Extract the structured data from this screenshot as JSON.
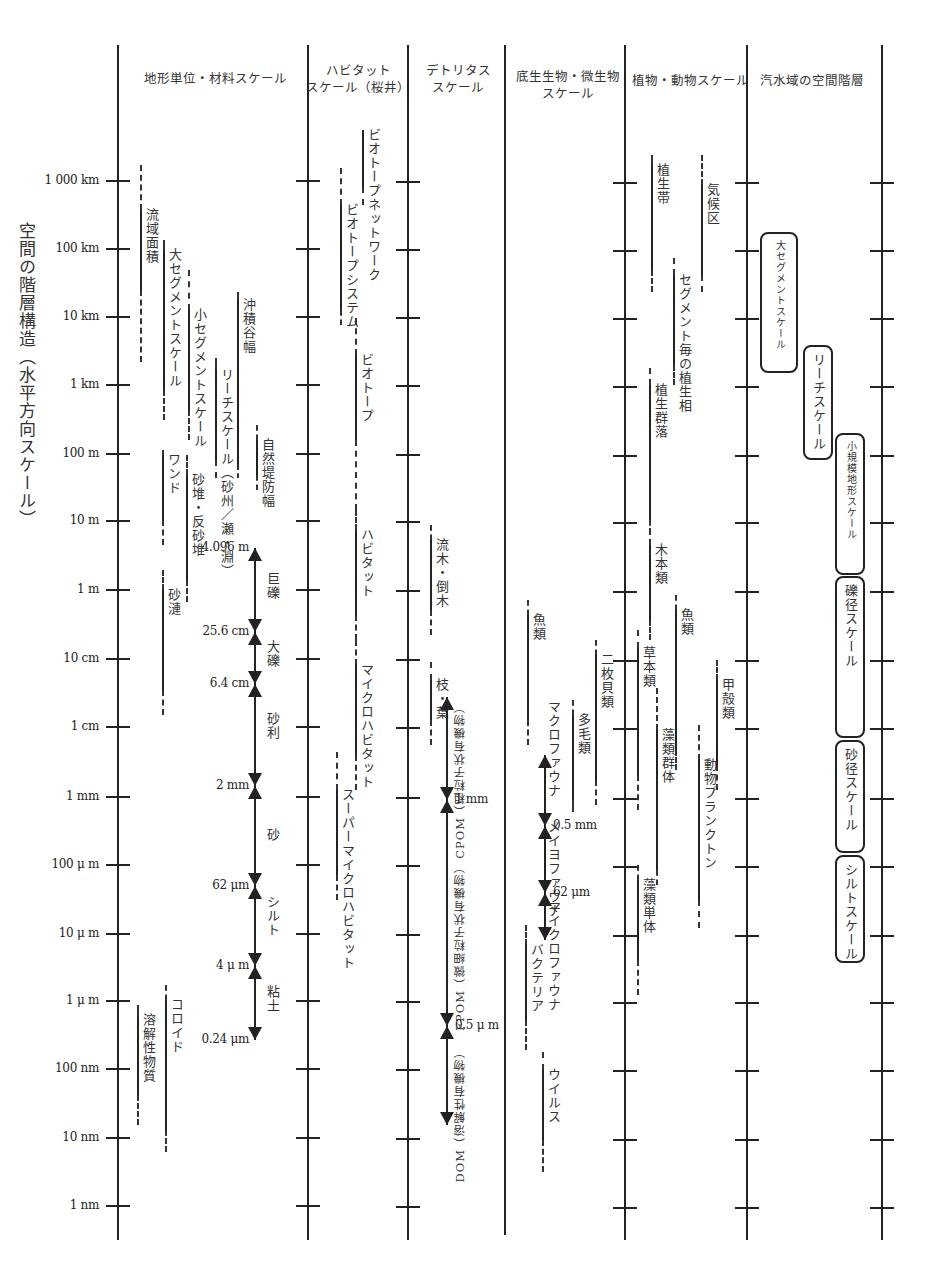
{
  "diagram": {
    "y_axis_title": "空間の階層構造（水平方向スケール）",
    "scale_ticks": [
      {
        "label": "1 000 km",
        "y": 181
      },
      {
        "label": "100 km",
        "y": 249
      },
      {
        "label": "10 km",
        "y": 317
      },
      {
        "label": "1 km",
        "y": 385
      },
      {
        "label": "100 m",
        "y": 454
      },
      {
        "label": "10 m",
        "y": 521
      },
      {
        "label": "1 m",
        "y": 590
      },
      {
        "label": "10 cm",
        "y": 659
      },
      {
        "label": "1 cm",
        "y": 727
      },
      {
        "label": "1 mm",
        "y": 797
      },
      {
        "label": "100 μ m",
        "y": 865
      },
      {
        "label": "10 μ m",
        "y": 934
      },
      {
        "label": "1 μ m",
        "y": 1001
      },
      {
        "label": "100 nm",
        "y": 1069
      },
      {
        "label": "10 nm",
        "y": 1138
      },
      {
        "label": "1 nm",
        "y": 1206
      }
    ],
    "columns": [
      {
        "id": "landform",
        "header": [
          "地形単位・材料スケール"
        ],
        "axis_x": 118,
        "header_x": 215,
        "header_y": 70
      },
      {
        "id": "habitat",
        "header": [
          "ハビタット",
          "スケール（桜井）"
        ],
        "axis_x": 308,
        "header_x": 358,
        "header_y": 62
      },
      {
        "id": "detritus",
        "header": [
          "デトリタス",
          "スケール"
        ],
        "axis_x": 408,
        "header_x": 458,
        "header_y": 62
      },
      {
        "id": "benthos",
        "header": [
          "底生生物・微生物",
          "スケール"
        ],
        "axis_x": 505,
        "header_x": 568,
        "header_y": 68
      },
      {
        "id": "plant_animal",
        "header": [
          "植物・動物スケール"
        ],
        "axis_x": 625,
        "header_x": 690,
        "header_y": 72
      },
      {
        "id": "estuary",
        "header": [
          "汽水域の空間階層"
        ],
        "axis_x": 747,
        "header_x": 812,
        "header_y": 72
      },
      {
        "id": "end",
        "header": [],
        "axis_x": 882
      }
    ],
    "ranges": [
      {
        "label": "流域面積",
        "x": 140,
        "top": 165,
        "solid_top": 210,
        "solid_bottom": 290,
        "bottom": 362
      },
      {
        "label": "大セグメントスケール",
        "x": 163,
        "top": 240,
        "solid_top": 250,
        "solid_bottom": 390,
        "bottom": 420
      },
      {
        "label": "小セグメントスケール",
        "x": 188,
        "top": 270,
        "solid_top": 310,
        "solid_bottom": 410,
        "bottom": 440
      },
      {
        "label": "リーチスケール（砂州／瀬・淵）",
        "x": 215,
        "top": 358,
        "solid_top": 370,
        "solid_bottom": 460,
        "bottom": 478
      },
      {
        "label": "沖積谷幅",
        "x": 237,
        "top": 292,
        "solid_top": 300,
        "solid_bottom": 465,
        "bottom": 478
      },
      {
        "label": "自然堤防幅",
        "x": 256,
        "top": 425,
        "solid_top": 440,
        "solid_bottom": 475,
        "bottom": 490
      },
      {
        "label": "ワンド",
        "x": 162,
        "top": 450,
        "solid_top": 455,
        "solid_bottom": 520,
        "bottom": 545
      },
      {
        "label": "砂堆・反砂堆",
        "x": 186,
        "top": 455,
        "solid_top": 475,
        "solid_bottom": 580,
        "bottom": 602
      },
      {
        "label": "砂漣",
        "x": 162,
        "top": 570,
        "solid_top": 590,
        "solid_bottom": 690,
        "bottom": 715
      },
      {
        "label": "溶解性物質",
        "x": 137,
        "top": 1005,
        "solid_top": 1015,
        "solid_bottom": 1095,
        "bottom": 1125
      },
      {
        "label": "コロイド",
        "x": 165,
        "top": 985,
        "solid_top": 1000,
        "solid_bottom": 1130,
        "bottom": 1152
      },
      {
        "label": "ビオトープネットワーク",
        "x": 362,
        "top": 130,
        "solid_top": 130,
        "solid_bottom": 187,
        "bottom": 205
      },
      {
        "label": "ビオトープシステム",
        "x": 340,
        "top": 168,
        "solid_top": 205,
        "solid_bottom": 310,
        "bottom": 325
      },
      {
        "label": "ビオトープ",
        "x": 355,
        "top": 318,
        "solid_top": 355,
        "solid_bottom": 440,
        "bottom": 510
      },
      {
        "label": "ハビタット",
        "x": 355,
        "top": 510,
        "solid_top": 530,
        "solid_bottom": 615,
        "bottom": 640
      },
      {
        "label": "マイクロハビタット",
        "x": 355,
        "top": 640,
        "solid_top": 665,
        "solid_bottom": 755,
        "bottom": 790
      },
      {
        "label": "スーパーマイクロハビタット",
        "x": 336,
        "top": 752,
        "solid_top": 790,
        "solid_bottom": 875,
        "bottom": 900
      },
      {
        "label": "流木・倒木",
        "x": 430,
        "top": 525,
        "solid_top": 540,
        "solid_bottom": 610,
        "bottom": 635
      },
      {
        "label": "枝・葉",
        "x": 430,
        "top": 662,
        "solid_top": 680,
        "solid_bottom": 720,
        "bottom": 745
      },
      {
        "label": "魚類",
        "x": 527,
        "top": 600,
        "solid_top": 615,
        "solid_bottom": 720,
        "bottom": 745
      },
      {
        "label": "多毛類",
        "x": 572,
        "top": 700,
        "solid_top": 715,
        "solid_bottom": 800,
        "bottom": 812
      },
      {
        "label": "二枚貝類",
        "x": 595,
        "top": 640,
        "solid_top": 655,
        "solid_bottom": 780,
        "bottom": 805
      },
      {
        "label": "バクテリア",
        "x": 525,
        "top": 925,
        "solid_top": 945,
        "solid_bottom": 1020,
        "bottom": 1050
      },
      {
        "label": "ウイルス",
        "x": 542,
        "top": 1052,
        "solid_top": 1070,
        "solid_bottom": 1140,
        "bottom": 1172
      },
      {
        "label": "植生帯",
        "x": 651,
        "top": 155,
        "solid_top": 165,
        "solid_bottom": 270,
        "bottom": 292
      },
      {
        "label": "気候区",
        "x": 701,
        "top": 155,
        "solid_top": 185,
        "solid_bottom": 275,
        "bottom": 292
      },
      {
        "label": "セグメント毎の植生相",
        "x": 673,
        "top": 258,
        "solid_top": 275,
        "solid_bottom": 365,
        "bottom": 385
      },
      {
        "label": "植生群落",
        "x": 649,
        "top": 368,
        "solid_top": 385,
        "solid_bottom": 520,
        "bottom": 535
      },
      {
        "label": "木本類",
        "x": 649,
        "top": 528,
        "solid_top": 545,
        "solid_bottom": 620,
        "bottom": 640
      },
      {
        "label": "魚類",
        "x": 675,
        "top": 595,
        "solid_top": 610,
        "solid_bottom": 750,
        "bottom": 770
      },
      {
        "label": "草本類",
        "x": 637,
        "top": 630,
        "solid_top": 648,
        "solid_bottom": 775,
        "bottom": 810
      },
      {
        "label": "藻類群体",
        "x": 656,
        "top": 688,
        "solid_top": 730,
        "solid_bottom": 870,
        "bottom": 885
      },
      {
        "label": "甲殻類",
        "x": 716,
        "top": 660,
        "solid_top": 680,
        "solid_bottom": 765,
        "bottom": 790
      },
      {
        "label": "動物プランクトン",
        "x": 698,
        "top": 725,
        "solid_top": 760,
        "solid_bottom": 900,
        "bottom": 928
      },
      {
        "label": "藻類単体",
        "x": 637,
        "top": 865,
        "solid_top": 880,
        "solid_bottom": 960,
        "bottom": 995
      }
    ],
    "arrow_scales": [
      {
        "id": "grain-size",
        "x": 255,
        "label_side": "right",
        "bounds": [
          {
            "label": "4.096 m",
            "y": 548
          },
          {
            "label": "25.6 cm",
            "y": 632
          },
          {
            "label": "6.4 cm",
            "y": 684
          },
          {
            "label": "2 mm",
            "y": 786
          },
          {
            "label": "62 μm",
            "y": 886
          },
          {
            "label": "4 μ m",
            "y": 966
          },
          {
            "label": "0.24 μm",
            "y": 1040
          }
        ],
        "classes": [
          {
            "label": "巨礫",
            "y": 572
          },
          {
            "label": "大礫",
            "y": 640
          },
          {
            "label": "砂利",
            "y": 712
          },
          {
            "label": "砂",
            "y": 828
          },
          {
            "label": "シルト",
            "y": 895
          },
          {
            "label": "粘土",
            "y": 985
          }
        ]
      },
      {
        "id": "organic-matter",
        "x": 447,
        "bounds": [
          {
            "label": "",
            "y": 697
          },
          {
            "label": "1 mm",
            "y": 800
          },
          {
            "label": "0.5 μ m",
            "y": 1026
          },
          {
            "label": "",
            "y": 1125
          }
        ],
        "classes": [
          {
            "label": "CPOM（粗粒子状有機物）",
            "y": 700
          },
          {
            "label": "FPOM（微細粒子状有機物）",
            "y": 860
          },
          {
            "label": "DOM（溶解性有機物）",
            "y": 1045
          }
        ]
      },
      {
        "id": "fauna-size",
        "x": 545,
        "bounds": [
          {
            "label": "",
            "y": 755
          },
          {
            "label": "0.5 mm",
            "y": 826
          },
          {
            "label": "62 μm",
            "y": 893
          },
          {
            "label": "",
            "y": 940
          }
        ],
        "classes": [
          {
            "label": "マクロファウナ",
            "y": 700
          },
          {
            "label": "メイヨファウナ",
            "y": 820
          },
          {
            "label": "マイクロファウナ",
            "y": 900
          }
        ]
      }
    ],
    "estuary_boxes": [
      {
        "label": "大セグメントスケール",
        "x": 760,
        "top": 232,
        "bottom": 373,
        "width": 38
      },
      {
        "label": "リーチスケール",
        "x": 803,
        "top": 345,
        "bottom": 460,
        "width": 30
      },
      {
        "label": "小規模地形スケール",
        "x": 835,
        "top": 433,
        "bottom": 575,
        "width": 30
      },
      {
        "label": "礫径スケール",
        "x": 835,
        "top": 576,
        "bottom": 738,
        "width": 30
      },
      {
        "label": "砂径スケール",
        "x": 835,
        "top": 740,
        "bottom": 853,
        "width": 30
      },
      {
        "label": "シルトスケール",
        "x": 835,
        "top": 855,
        "bottom": 963,
        "width": 30
      }
    ]
  }
}
